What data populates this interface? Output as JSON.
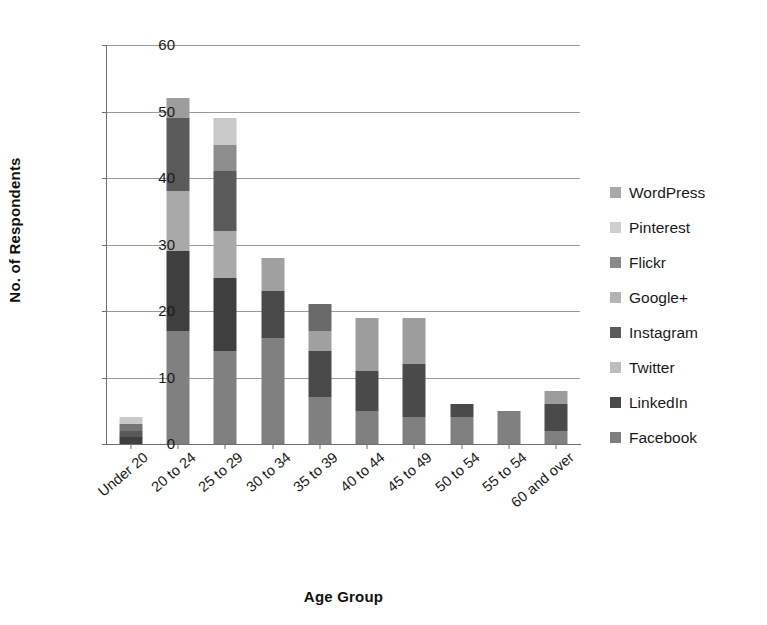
{
  "chart_data": {
    "type": "bar",
    "subtype": "stacked-vertical",
    "title": "",
    "xlabel": "Age Group",
    "ylabel": "No. of Respondents",
    "ylim": [
      0,
      60
    ],
    "yticks": [
      0,
      10,
      20,
      30,
      40,
      50,
      60
    ],
    "grid": true,
    "legend_position": "right",
    "categories": [
      "Under 20",
      "20 to 24",
      "25 to 29",
      "30 to 34",
      "35 to 39",
      "40 to 44",
      "45 to 49",
      "50 to 54",
      "55 to 54",
      "60 and over"
    ],
    "series": [
      {
        "name": "Facebook",
        "color": "#808080",
        "values": [
          0,
          17,
          14,
          16,
          7,
          5,
          4,
          0,
          0,
          0
        ]
      },
      {
        "name": "LinkedIn",
        "color": "#3f3f3f",
        "values": [
          1,
          12,
          0,
          0,
          7,
          6,
          8,
          4,
          5,
          6
        ]
      },
      {
        "name": "Twitter",
        "color": "#b3b3b3",
        "values": [
          0,
          0,
          0,
          0,
          0,
          0,
          0,
          0,
          0,
          0
        ]
      },
      {
        "name": "Instagram",
        "color": "#595959",
        "values": [
          1,
          9,
          18,
          0,
          0,
          0,
          0,
          0,
          0,
          0
        ]
      },
      {
        "name": "Google+",
        "color": "#a6a6a6",
        "values": [
          0,
          0,
          0,
          0,
          0,
          0,
          0,
          0,
          0,
          0
        ]
      },
      {
        "name": "Flickr",
        "color": "#767676",
        "values": [
          1,
          11,
          4,
          0,
          0,
          0,
          0,
          0,
          0,
          0
        ]
      },
      {
        "name": "Pinterest",
        "color": "#c9c9c9",
        "values": [
          1,
          0,
          0,
          0,
          0,
          0,
          0,
          0,
          0,
          0
        ]
      },
      {
        "name": "WordPress",
        "color": "#9d9d9d",
        "values": [
          0,
          3,
          13,
          12,
          7,
          8,
          7,
          2,
          0,
          2
        ]
      }
    ],
    "totals": [
      4,
      52,
      49,
      28,
      21,
      19,
      19,
      6,
      5,
      8
    ],
    "bar_stacks": [
      {
        "category": "Under 20",
        "total": 4,
        "segments": [
          {
            "series": "LinkedIn",
            "value": 1,
            "color": "#3f3f3f"
          },
          {
            "series": "Instagram",
            "value": 1,
            "color": "#595959"
          },
          {
            "series": "Flickr",
            "value": 1,
            "color": "#767676"
          },
          {
            "series": "Pinterest",
            "value": 1,
            "color": "#c9c9c9"
          }
        ]
      },
      {
        "category": "20 to 24",
        "total": 52,
        "segments": [
          {
            "series": "Facebook",
            "value": 17,
            "color": "#808080"
          },
          {
            "series": "LinkedIn",
            "value": 12,
            "color": "#3f3f3f"
          },
          {
            "series": "Instagram",
            "value": 9,
            "color": "#a9a9a9"
          },
          {
            "series": "Flickr",
            "value": 11,
            "color": "#5a5a5a"
          },
          {
            "series": "WordPress",
            "value": 3,
            "color": "#9d9d9d"
          }
        ]
      },
      {
        "category": "25 to 29",
        "total": 49,
        "segments": [
          {
            "series": "Facebook",
            "value": 14,
            "color": "#808080"
          },
          {
            "series": "LinkedIn",
            "value": 11,
            "color": "#3f3f3f"
          },
          {
            "series": "Instagram",
            "value": 7,
            "color": "#a9a9a9"
          },
          {
            "series": "Flickr",
            "value": 9,
            "color": "#5a5a5a"
          },
          {
            "series": "Pinterest",
            "value": 4,
            "color": "#8d8d8d"
          },
          {
            "series": "WordPress",
            "value": 4,
            "color": "#c9c9c9"
          }
        ]
      },
      {
        "category": "30 to 34",
        "total": 28,
        "segments": [
          {
            "series": "Facebook",
            "value": 16,
            "color": "#808080"
          },
          {
            "series": "LinkedIn",
            "value": 7,
            "color": "#4a4a4a"
          },
          {
            "series": "WordPress",
            "value": 5,
            "color": "#a0a0a0"
          }
        ]
      },
      {
        "category": "35 to 39",
        "total": 21,
        "segments": [
          {
            "series": "Facebook",
            "value": 7,
            "color": "#808080"
          },
          {
            "series": "LinkedIn",
            "value": 7,
            "color": "#4a4a4a"
          },
          {
            "series": "Instagram",
            "value": 3,
            "color": "#a0a0a0"
          },
          {
            "series": "WordPress",
            "value": 4,
            "color": "#6a6a6a"
          }
        ]
      },
      {
        "category": "40 to 44",
        "total": 19,
        "segments": [
          {
            "series": "Facebook",
            "value": 5,
            "color": "#808080"
          },
          {
            "series": "LinkedIn",
            "value": 6,
            "color": "#4a4a4a"
          },
          {
            "series": "WordPress",
            "value": 8,
            "color": "#9d9d9d"
          }
        ]
      },
      {
        "category": "45 to 49",
        "total": 19,
        "segments": [
          {
            "series": "Facebook",
            "value": 4,
            "color": "#808080"
          },
          {
            "series": "LinkedIn",
            "value": 8,
            "color": "#4a4a4a"
          },
          {
            "series": "WordPress",
            "value": 7,
            "color": "#9d9d9d"
          }
        ]
      },
      {
        "category": "50 to 54",
        "total": 6,
        "segments": [
          {
            "series": "Facebook",
            "value": 4,
            "color": "#808080"
          },
          {
            "series": "LinkedIn",
            "value": 2,
            "color": "#4a4a4a"
          }
        ]
      },
      {
        "category": "55 to 54",
        "total": 5,
        "segments": [
          {
            "series": "Facebook",
            "value": 5,
            "color": "#808080"
          }
        ]
      },
      {
        "category": "60 and over",
        "total": 8,
        "segments": [
          {
            "series": "Facebook",
            "value": 2,
            "color": "#808080"
          },
          {
            "series": "LinkedIn",
            "value": 4,
            "color": "#4a4a4a"
          },
          {
            "series": "WordPress",
            "value": 2,
            "color": "#9d9d9d"
          }
        ]
      }
    ],
    "legend": [
      {
        "label": "WordPress",
        "color": "#a8a8a8"
      },
      {
        "label": "Pinterest",
        "color": "#cfcfcf"
      },
      {
        "label": "Flickr",
        "color": "#8a8a8a"
      },
      {
        "label": "Google+",
        "color": "#b4b4b4"
      },
      {
        "label": "Instagram",
        "color": "#5c5c5c"
      },
      {
        "label": "Twitter",
        "color": "#bdbdbd"
      },
      {
        "label": "LinkedIn",
        "color": "#4a4a4a"
      },
      {
        "label": "Facebook",
        "color": "#7e7e7e"
      }
    ]
  }
}
